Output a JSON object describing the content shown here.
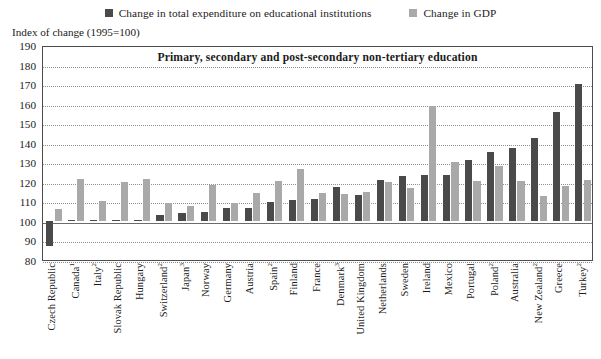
{
  "legend": {
    "items": [
      {
        "label": "Change in total expenditure on educational institutions",
        "color": "#4a4a4a",
        "icon": "square-swatch-dark"
      },
      {
        "label": "Change in GDP",
        "color": "#a9a9a9",
        "icon": "square-swatch-light"
      }
    ]
  },
  "axis_caption": "Index of change (1995=100)",
  "chart_data": {
    "type": "bar",
    "title": "Primary, secondary and post-secondary non-tertiary education",
    "xlabel": "",
    "ylabel": "Index of change (1995=100)",
    "ylim": [
      80,
      190
    ],
    "ytick_step": 10,
    "yticks": [
      80,
      90,
      100,
      110,
      120,
      130,
      140,
      150,
      160,
      170,
      180,
      190
    ],
    "grid": true,
    "reference_line": 100,
    "legend_position": "top-center",
    "categories": [
      "Czech Republic",
      "Canada¹",
      "Italy²",
      "Slovak Republic",
      "Hungary",
      "Switzerland²",
      "Japan³",
      "Norway",
      "Germany",
      "Austria",
      "Spain²",
      "Finland",
      "France",
      "Denmark³",
      "United Kingdom",
      "Netherlands",
      "Sweden",
      "Ireland",
      "Mexico",
      "Portugal",
      "Poland²",
      "Australia",
      "New Zealand²",
      "Greece",
      "Turkey²"
    ],
    "category_labels": [
      {
        "name": "Czech Republic",
        "sup": ""
      },
      {
        "name": "Canada",
        "sup": "1"
      },
      {
        "name": "Italy",
        "sup": "2"
      },
      {
        "name": "Slovak Republic",
        "sup": ""
      },
      {
        "name": "Hungary",
        "sup": ""
      },
      {
        "name": "Switzerland",
        "sup": "2"
      },
      {
        "name": "Japan",
        "sup": "3"
      },
      {
        "name": "Norway",
        "sup": ""
      },
      {
        "name": "Germany",
        "sup": ""
      },
      {
        "name": "Austria",
        "sup": ""
      },
      {
        "name": "Spain",
        "sup": "2"
      },
      {
        "name": "Finland",
        "sup": ""
      },
      {
        "name": "France",
        "sup": ""
      },
      {
        "name": "Denmark",
        "sup": "3"
      },
      {
        "name": "United Kingdom",
        "sup": ""
      },
      {
        "name": "Netherlands",
        "sup": ""
      },
      {
        "name": "Sweden",
        "sup": ""
      },
      {
        "name": "Ireland",
        "sup": ""
      },
      {
        "name": "Mexico",
        "sup": ""
      },
      {
        "name": "Portugal",
        "sup": ""
      },
      {
        "name": "Poland",
        "sup": "2"
      },
      {
        "name": "Australia",
        "sup": ""
      },
      {
        "name": "New Zealand",
        "sup": "2"
      },
      {
        "name": "Greece",
        "sup": ""
      },
      {
        "name": "Turkey",
        "sup": "2"
      }
    ],
    "series": [
      {
        "name": "Change in total expenditure on educational institutions",
        "color": "#4a4a4a",
        "values": [
          87,
          100,
          100,
          100,
          100.5,
          103,
          104,
          104.5,
          106.5,
          106.5,
          109.5,
          110.5,
          111,
          117.5,
          113.5,
          121,
          123,
          123.5,
          123.5,
          131,
          135.5,
          137.5,
          142.5,
          155.5,
          170
        ]
      },
      {
        "name": "Change in GDP",
        "color": "#a9a9a9",
        "values": [
          106,
          121.5,
          110,
          120,
          121.5,
          109,
          107.5,
          118.5,
          109,
          114.5,
          120.5,
          126.5,
          114.5,
          114,
          115,
          120,
          117,
          159,
          130,
          120.5,
          128,
          120.5,
          113,
          118,
          121
        ]
      }
    ]
  }
}
